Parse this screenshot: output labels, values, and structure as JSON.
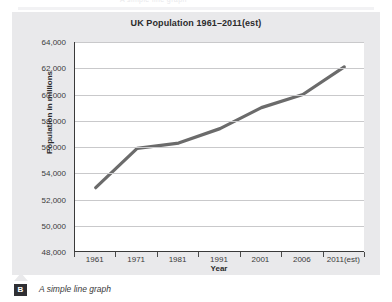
{
  "figure": {
    "caption_badge": "B",
    "caption_text": "A simple line graph",
    "bleed_text": "A simple line graph"
  },
  "chart_data": {
    "type": "line",
    "title": "UK Population 1961–2011(est)",
    "xlabel": "Year",
    "ylabel": "Population in millions",
    "categories": [
      "1961",
      "1971",
      "1981",
      "1991",
      "2001",
      "2006",
      "2011(est)"
    ],
    "values": [
      52900,
      55900,
      56300,
      57400,
      59000,
      60000,
      62100
    ],
    "ylim": [
      48000,
      64000
    ],
    "ytick_labels": [
      "64,000",
      "62,000",
      "60,000",
      "58,000",
      "56,000",
      "54,000",
      "52,000",
      "50,000",
      "48,000"
    ],
    "ytick_values": [
      64000,
      62000,
      60000,
      58000,
      56000,
      54000,
      52000,
      50000,
      48000
    ],
    "grid": true,
    "legend": "none",
    "series_color": "#6b6b6b",
    "grid_color": "#c9c9cb",
    "axis_color": "#3a3a3a",
    "plot_background": "#ffffff",
    "panel_background": "#e9e9eb"
  }
}
